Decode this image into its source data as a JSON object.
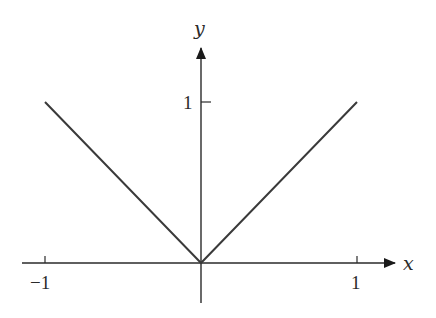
{
  "chart_data": {
    "type": "line",
    "title": "",
    "function": "y = |x|",
    "xlabel": "x",
    "ylabel": "y",
    "xlim": [
      -1.35,
      1.45
    ],
    "ylim": [
      -0.25,
      1.45
    ],
    "grid": false,
    "legend": null,
    "x_ticks": [
      {
        "value": -1,
        "label": "−1"
      },
      {
        "value": 1,
        "label": "1"
      }
    ],
    "y_ticks": [
      {
        "value": 1,
        "label": "1"
      }
    ],
    "series": [
      {
        "name": "|x|",
        "color": "#3a3a3a",
        "points": [
          {
            "x": -1,
            "y": 1
          },
          {
            "x": 0,
            "y": 0
          },
          {
            "x": 1,
            "y": 1
          }
        ]
      }
    ]
  },
  "colors": {
    "axis": "#2a2a2a",
    "line": "#3a3a3a",
    "background": "#ffffff"
  }
}
